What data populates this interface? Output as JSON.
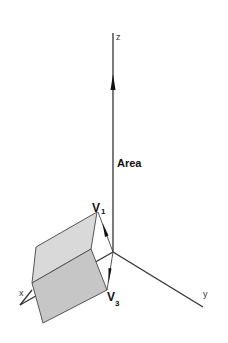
{
  "diagram": {
    "axes": {
      "x_label": "x",
      "y_label": "y",
      "z_label": "z"
    },
    "vectors": [
      {
        "name": "V",
        "subscript": "1"
      },
      {
        "name": "V",
        "subscript": "3"
      }
    ],
    "area_label": "Area",
    "colors": {
      "background": "#ffffff",
      "axis": "#333333",
      "top_face": "#d9d9d9",
      "front_face": "#c6c6c6",
      "edge": "#555555"
    }
  }
}
